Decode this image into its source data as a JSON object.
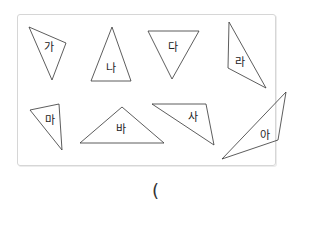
{
  "figure": {
    "stroke_color": "#333333",
    "border_color": "#d6d6d6",
    "triangles": [
      {
        "label": "가",
        "points": "29,27 66,43 52,80",
        "label_x": 49,
        "label_y": 47
      },
      {
        "label": "나",
        "points": "112,27 91,81 131,81",
        "label_x": 111,
        "label_y": 68
      },
      {
        "label": "다",
        "points": "148,31 199,31 172,79",
        "label_x": 173,
        "label_y": 47
      },
      {
        "label": "라",
        "points": "229,22 228,68 266,88",
        "label_x": 240,
        "label_y": 62
      },
      {
        "label": "마",
        "points": "30,110 59,104 62,150",
        "label_x": 50,
        "label_y": 120
      },
      {
        "label": "바",
        "points": "80,143 122,107 164,143",
        "label_x": 121,
        "label_y": 129
      },
      {
        "label": "사",
        "points": "152,104 206,104 214,145",
        "label_x": 193,
        "label_y": 117
      },
      {
        "label": "아",
        "points": "222,159 278,140 286,92",
        "label_x": 265,
        "label_y": 135
      }
    ]
  },
  "answer": {
    "open_paren": "("
  }
}
